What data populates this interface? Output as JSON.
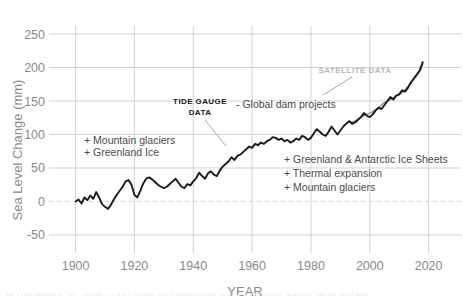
{
  "chart_data": {
    "type": "line",
    "title": "",
    "xlabel": "YEAR",
    "ylabel": "Sea Level Change (mm)",
    "xlim": [
      1893,
      2031
    ],
    "ylim": [
      -62,
      262
    ],
    "xticks": [
      1900,
      1920,
      1940,
      1960,
      1980,
      2000,
      2020
    ],
    "yticks": [
      -50,
      0,
      50,
      100,
      150,
      200,
      250
    ],
    "grid": true,
    "legend": "none",
    "zero_reference_line": 0,
    "series": [
      {
        "name": "Tide gauge data",
        "color": "#1a1a1a",
        "x": [
          1900,
          1901,
          1902,
          1903,
          1904,
          1905,
          1906,
          1907,
          1908,
          1909,
          1910,
          1911,
          1912,
          1913,
          1914,
          1915,
          1916,
          1917,
          1918,
          1919,
          1920,
          1921,
          1922,
          1923,
          1924,
          1925,
          1926,
          1927,
          1928,
          1929,
          1930,
          1931,
          1932,
          1933,
          1934,
          1935,
          1936,
          1937,
          1938,
          1939,
          1940,
          1941,
          1942,
          1943,
          1944,
          1945,
          1946,
          1947,
          1948,
          1949,
          1950,
          1951,
          1952,
          1953,
          1954,
          1955,
          1956,
          1957,
          1958,
          1959,
          1960,
          1961,
          1962,
          1963,
          1964,
          1965,
          1966,
          1967,
          1968,
          1969,
          1970,
          1971,
          1972,
          1973,
          1974,
          1975,
          1976,
          1977,
          1978,
          1979,
          1980,
          1981,
          1982,
          1983,
          1984,
          1985,
          1986,
          1987,
          1988,
          1989,
          1990,
          1991,
          1992,
          1993,
          1994,
          1995,
          1996,
          1997,
          1998,
          1999,
          2000,
          2001,
          2002,
          2003,
          2004,
          2005,
          2006,
          2007,
          2008,
          2009,
          2010,
          2011,
          2012,
          2013,
          2014,
          2015,
          2016,
          2017,
          2018
        ],
        "y": [
          0,
          3,
          -3,
          6,
          2,
          9,
          4,
          14,
          6,
          -4,
          -8,
          -11,
          -5,
          3,
          10,
          16,
          22,
          30,
          32,
          25,
          10,
          6,
          16,
          27,
          34,
          36,
          33,
          29,
          25,
          22,
          20,
          22,
          26,
          30,
          34,
          28,
          22,
          20,
          26,
          24,
          30,
          35,
          43,
          38,
          34,
          42,
          45,
          40,
          38,
          46,
          52,
          56,
          60,
          66,
          62,
          68,
          70,
          74,
          78,
          82,
          80,
          86,
          84,
          88,
          86,
          90,
          92,
          96,
          95,
          92,
          94,
          90,
          92,
          88,
          90,
          94,
          92,
          98,
          96,
          92,
          95,
          102,
          108,
          104,
          100,
          98,
          104,
          112,
          106,
          100,
          106,
          112,
          116,
          120,
          116,
          118,
          122,
          126,
          132,
          128,
          126,
          130,
          136,
          140,
          138,
          144,
          150,
          156,
          152,
          158,
          160,
          166,
          164,
          170,
          178,
          184,
          190,
          196,
          208
        ]
      },
      {
        "name": "Satellite data",
        "color": "#9d9d9d",
        "x": [
          1993,
          1995,
          1997,
          1999,
          2001,
          2003,
          2005,
          2007,
          2009,
          2011,
          2013,
          2015,
          2017,
          2018
        ],
        "y": [
          118,
          120,
          126,
          130,
          134,
          140,
          148,
          152,
          158,
          162,
          172,
          182,
          194,
          205
        ]
      }
    ],
    "annotations": [
      {
        "name": "tide-gauge-data",
        "text": "TIDE GAUGE",
        "style": "bold-dark",
        "x": 200,
        "y": 104
      },
      {
        "name": "tide-gauge-data-line2",
        "text": "DATA",
        "style": "bold-dark",
        "x": 200,
        "y": 115
      },
      {
        "name": "satellite-data",
        "text": "SATELLITE DATA",
        "style": "bold-gray",
        "x": 355,
        "y": 73
      },
      {
        "name": "global-dam-projects",
        "text": "- Global dam projects",
        "style": "plain",
        "x": 236,
        "y": 108
      },
      {
        "name": "mountain-glaciers-left",
        "text": "+ Mountain glaciers",
        "style": "plain",
        "x": 84,
        "y": 144
      },
      {
        "name": "greenland-ice-left",
        "text": "+ Greenland Ice",
        "style": "plain",
        "x": 84,
        "y": 156
      },
      {
        "name": "greenland-antarctic-ice-sheets",
        "text": "+ Greenland & Antarctic Ice Sheets",
        "style": "plain",
        "x": 284,
        "y": 163
      },
      {
        "name": "thermal-expansion",
        "text": "+ Thermal expansion",
        "style": "plain",
        "x": 284,
        "y": 177
      },
      {
        "name": "mountain-glaciers-right",
        "text": "+ Mountain glaciers",
        "style": "plain",
        "x": 284,
        "y": 191
      }
    ]
  },
  "colors": {
    "line": "#1a1a1a",
    "satellite": "#9d9d9d",
    "grid": "#d2d3d5",
    "tick_text": "#8a8a8a",
    "annotation_text": "#4a4a4a",
    "background": "#ffffff"
  },
  "caption_cut": "a measure of sea level rise in millimetres between 1900 and 2018"
}
